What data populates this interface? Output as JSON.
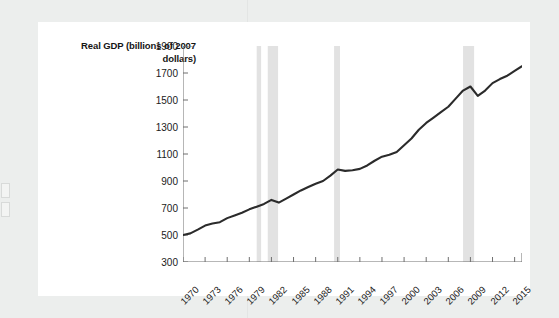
{
  "page": {
    "background_color": "#eceeed",
    "card_color": "#ffffff"
  },
  "chart_data": {
    "type": "line",
    "title": "",
    "ylabel": "Real GDP (billions of 2007 dollars)",
    "xlabel": "",
    "ylim": [
      300,
      1900
    ],
    "xlim": [
      1970,
      2016
    ],
    "grid": false,
    "legend": "none",
    "line_color": "#2b2b2b",
    "recession_band_color": "#e2e2e2",
    "yticks": [
      300,
      500,
      700,
      900,
      1100,
      1300,
      1500,
      1700,
      1900
    ],
    "xticks": [
      1970,
      1973,
      1976,
      1979,
      1982,
      1985,
      1988,
      1991,
      1994,
      1997,
      2000,
      2003,
      2006,
      2009,
      2012,
      2015
    ],
    "recessions": [
      {
        "label": "1980 recession",
        "start": 1980.0,
        "end": 1980.6
      },
      {
        "label": "1981-82 recession",
        "start": 1981.5,
        "end": 1982.9
      },
      {
        "label": "1990-91 recession",
        "start": 1990.5,
        "end": 1991.3
      },
      {
        "label": "2007-09 recession",
        "start": 2008.0,
        "end": 2009.5
      }
    ],
    "series": [
      {
        "name": "Real GDP",
        "x": [
          1970,
          1971,
          1972,
          1973,
          1974,
          1975,
          1976,
          1977,
          1978,
          1979,
          1980,
          1981,
          1982,
          1983,
          1984,
          1985,
          1986,
          1987,
          1988,
          1989,
          1990,
          1991,
          1992,
          1993,
          1994,
          1995,
          1996,
          1997,
          1998,
          1999,
          2000,
          2001,
          2002,
          2003,
          2004,
          2005,
          2006,
          2007,
          2008,
          2009,
          2010,
          2011,
          2012,
          2013,
          2014,
          2015,
          2016
        ],
        "values": [
          500,
          512,
          540,
          570,
          585,
          595,
          625,
          645,
          665,
          690,
          710,
          730,
          760,
          740,
          770,
          800,
          830,
          855,
          880,
          900,
          940,
          985,
          975,
          980,
          990,
          1015,
          1050,
          1080,
          1095,
          1115,
          1165,
          1215,
          1280,
          1330,
          1370,
          1410,
          1450,
          1510,
          1570,
          1600,
          1530,
          1570,
          1625,
          1655,
          1680,
          1715,
          1750
        ]
      }
    ]
  }
}
